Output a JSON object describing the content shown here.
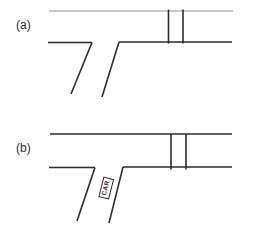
{
  "figure": {
    "type": "road-intersection-diagram",
    "background": "#ffffff",
    "colors": {
      "stroke": "#2b2b2b",
      "light_stroke": "#b4b4b4",
      "text": "#2b2b2b"
    },
    "panels": [
      {
        "id": "a",
        "label": "(a)",
        "label_pos": {
          "x": 16,
          "y": 19
        },
        "lines": [
          {
            "name": "main-road-top-edge",
            "x1": 49,
            "y1": 11,
            "x2": 233,
            "y2": 11,
            "light": true,
            "w": 1.4
          },
          {
            "name": "main-road-bottom-edge-left",
            "x1": 48,
            "y1": 42.5,
            "x2": 92,
            "y2": 42.5
          },
          {
            "name": "main-road-bottom-edge-right",
            "x1": 119,
            "y1": 42,
            "x2": 232,
            "y2": 42
          },
          {
            "name": "crossing-line-left",
            "x1": 168.5,
            "y1": 9.5,
            "x2": 168.5,
            "y2": 43.5
          },
          {
            "name": "crossing-line-right",
            "x1": 183,
            "y1": 9.5,
            "x2": 183,
            "y2": 43.5
          },
          {
            "name": "side-road-left-edge",
            "x1": 92,
            "y1": 42.5,
            "x2": 71,
            "y2": 94
          },
          {
            "name": "side-road-right-edge",
            "x1": 119,
            "y1": 42,
            "x2": 102,
            "y2": 97
          }
        ]
      },
      {
        "id": "b",
        "label": "(b)",
        "label_pos": {
          "x": 16,
          "y": 142
        },
        "lines": [
          {
            "name": "main-road-top-edge",
            "x1": 50,
            "y1": 134,
            "x2": 232,
            "y2": 134
          },
          {
            "name": "main-road-bottom-edge-left",
            "x1": 49,
            "y1": 167.5,
            "x2": 95,
            "y2": 167.5
          },
          {
            "name": "main-road-bottom-edge-right",
            "x1": 123,
            "y1": 167,
            "x2": 232,
            "y2": 167
          },
          {
            "name": "crossing-line-left",
            "x1": 171,
            "y1": 134,
            "x2": 171,
            "y2": 169.5
          },
          {
            "name": "crossing-line-right",
            "x1": 186,
            "y1": 134,
            "x2": 186,
            "y2": 169.5
          },
          {
            "name": "side-road-left-edge",
            "x1": 95,
            "y1": 167.5,
            "x2": 77,
            "y2": 221
          },
          {
            "name": "side-road-right-edge",
            "x1": 123,
            "y1": 167,
            "x2": 109,
            "y2": 223
          }
        ],
        "car_marker": {
          "label": "CAR",
          "cx": 106,
          "cy": 187.5,
          "width": 21,
          "height": 10.5,
          "rotation_deg": -76
        }
      }
    ]
  }
}
